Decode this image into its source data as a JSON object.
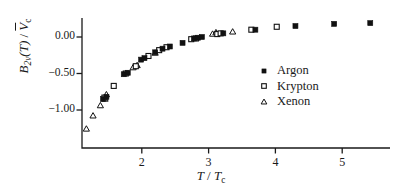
{
  "figure": {
    "background": "#ffffff",
    "ink": "#1a1a1a"
  },
  "axes": {
    "x_label_main": "T",
    "x_label_sep": " / ",
    "x_label_den": "T",
    "x_label_den_sub": "c",
    "y_label_main": "B",
    "y_label_main_sub": "2v",
    "y_label_arg": "(T)",
    "y_label_sep": " / ",
    "y_label_den": "V",
    "y_label_den_sub": "c",
    "x_ticks": [
      "2",
      "3",
      "4",
      "5"
    ],
    "y_ticks": [
      "0.00",
      "−0.50",
      "−1.00"
    ]
  },
  "legend": {
    "entries": [
      {
        "label": "Argon",
        "marker": "filled-square",
        "color": "#111111"
      },
      {
        "label": "Krypton",
        "marker": "open-square",
        "color": "#111111"
      },
      {
        "label": "Xenon",
        "marker": "open-triangle",
        "color": "#111111"
      }
    ]
  },
  "chart_data": {
    "type": "scatter",
    "title": "",
    "xlabel": "T / Tc",
    "ylabel": "B2v(T) / Vc",
    "xlim": [
      1.05,
      5.75
    ],
    "ylim": [
      -1.45,
      0.33
    ],
    "grid": false,
    "legend_position": "center-right",
    "x_tick_values": [
      2,
      3,
      4,
      5
    ],
    "y_tick_values": [
      0.0,
      -0.5,
      -1.0
    ],
    "series": [
      {
        "name": "Argon",
        "marker": "filled-square",
        "color": "#111111",
        "points": [
          [
            1.42,
            -0.85
          ],
          [
            1.47,
            -0.82
          ],
          [
            1.73,
            -0.51
          ],
          [
            1.79,
            -0.49
          ],
          [
            1.99,
            -0.31
          ],
          [
            2.04,
            -0.29
          ],
          [
            2.2,
            -0.21
          ],
          [
            2.31,
            -0.16
          ],
          [
            2.42,
            -0.13
          ],
          [
            2.61,
            -0.08
          ],
          [
            2.78,
            -0.02
          ],
          [
            2.84,
            -0.01
          ],
          [
            2.9,
            0.0
          ],
          [
            3.22,
            0.05
          ],
          [
            3.7,
            0.1
          ],
          [
            4.3,
            0.15
          ],
          [
            4.88,
            0.18
          ],
          [
            5.42,
            0.19
          ]
        ]
      },
      {
        "name": "Krypton",
        "marker": "open-square",
        "color": "#111111",
        "points": [
          [
            1.44,
            -0.83
          ],
          [
            1.58,
            -0.67
          ],
          [
            1.76,
            -0.5
          ],
          [
            1.91,
            -0.4
          ],
          [
            2.1,
            -0.26
          ],
          [
            2.26,
            -0.18
          ],
          [
            2.37,
            -0.14
          ],
          [
            2.74,
            -0.03
          ],
          [
            2.81,
            -0.02
          ],
          [
            3.13,
            0.04
          ],
          [
            3.18,
            0.05
          ],
          [
            3.64,
            0.1
          ],
          [
            4.02,
            0.14
          ]
        ]
      },
      {
        "name": "Xenon",
        "marker": "open-triangle",
        "color": "#111111",
        "points": [
          [
            1.17,
            -1.26
          ],
          [
            1.27,
            -1.08
          ],
          [
            1.38,
            -0.94
          ],
          [
            1.45,
            -0.85
          ],
          [
            1.47,
            -0.79
          ],
          [
            1.87,
            -0.42
          ],
          [
            1.93,
            -0.39
          ],
          [
            2.2,
            -0.22
          ],
          [
            3.06,
            0.04
          ],
          [
            3.11,
            0.06
          ],
          [
            3.36,
            0.07
          ]
        ]
      }
    ]
  },
  "geometry": {
    "plot_left_px": 82,
    "plot_bottom_px": 148,
    "plot_right_px": 390,
    "plot_top_px": 18,
    "x_pixel_at_T1": 75.0,
    "x_pixels_per_unit": 66.8,
    "y_pixel_at_0": 37.0,
    "y_pixels_per_unit": 73.0
  }
}
